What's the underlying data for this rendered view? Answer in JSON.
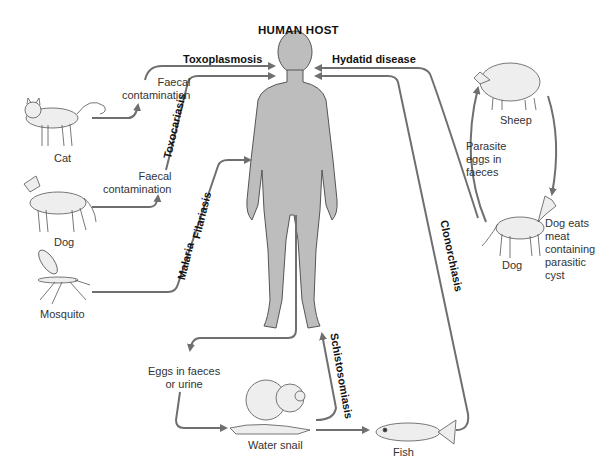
{
  "title": "HUMAN HOST",
  "diseases": {
    "toxoplasmosis": "Toxoplasmosis",
    "toxocariasis": "Toxocariasis",
    "filariasis": "Filariasis",
    "malaria": "Malaria",
    "hydatid": "Hydatid disease",
    "clonorchiasis": "Clonorchiasis",
    "schistosomiasis": "Schistosomiasis"
  },
  "sources": {
    "cat": "Cat",
    "dog_left": "Dog",
    "mosquito": "Mosquito",
    "sheep": "Sheep",
    "dog_right": "Dog",
    "water_snail": "Water snail",
    "fish": "Fish"
  },
  "notes": {
    "faecal_cat_1": "Faecal",
    "faecal_cat_2": "contamination",
    "faecal_dog_1": "Faecal",
    "faecal_dog_2": "contamination",
    "parasite_eggs_1": "Parasite",
    "parasite_eggs_2": "eggs in",
    "parasite_eggs_3": "faeces",
    "dog_eats_1": "Dog eats",
    "dog_eats_2": "meat",
    "dog_eats_3": "containing",
    "dog_eats_4": "parasitic",
    "dog_eats_5": "cyst",
    "eggs_faeces_1": "Eggs in faeces",
    "eggs_faeces_2": "or urine"
  },
  "colors": {
    "arrow": "#6f6f6f",
    "body_fill": "#bdbdbd",
    "body_outline": "#555555",
    "animal_fill": "#eeeeee"
  }
}
